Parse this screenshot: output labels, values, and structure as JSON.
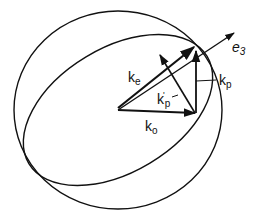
{
  "diagram": {
    "type": "vector-geometry",
    "stroke_color": "#111111",
    "background": "#ffffff",
    "shapes": {
      "outer_circle": {
        "cx": 118,
        "cy": 110,
        "rx": 104,
        "ry": 99
      },
      "inner_ellipse": {
        "cx": 118,
        "cy": 110,
        "rx": 104,
        "ry": 62,
        "rotation_deg": -31
      }
    },
    "origin": {
      "x": 118,
      "y": 110
    },
    "labels": {
      "k_e": {
        "base": "k",
        "sub": "e"
      },
      "k_o": {
        "base": "k",
        "sub": "o"
      },
      "k_p": {
        "base": "k",
        "sub": "p"
      },
      "k_p_prime": {
        "base": "k",
        "sub": "p",
        "sup": "'"
      },
      "e_3": {
        "base": "e",
        "sub": "3"
      }
    }
  }
}
